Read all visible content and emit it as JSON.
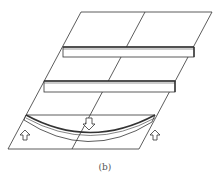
{
  "figure": {
    "caption": "(b)",
    "stroke_color": "#333333",
    "elements": [
      {
        "name": "slab",
        "type": "parallelogram"
      },
      {
        "name": "middle-divider",
        "type": "line"
      },
      {
        "name": "upper-bar",
        "type": "rectangular-bar"
      },
      {
        "name": "lower-bar",
        "type": "rectangular-bar"
      },
      {
        "name": "bent-beam",
        "type": "curved-beam"
      },
      {
        "name": "load-arrow",
        "type": "down-arrow"
      },
      {
        "name": "left-support-arrow",
        "type": "up-arrow"
      },
      {
        "name": "right-support-arrow",
        "type": "up-arrow"
      }
    ]
  }
}
